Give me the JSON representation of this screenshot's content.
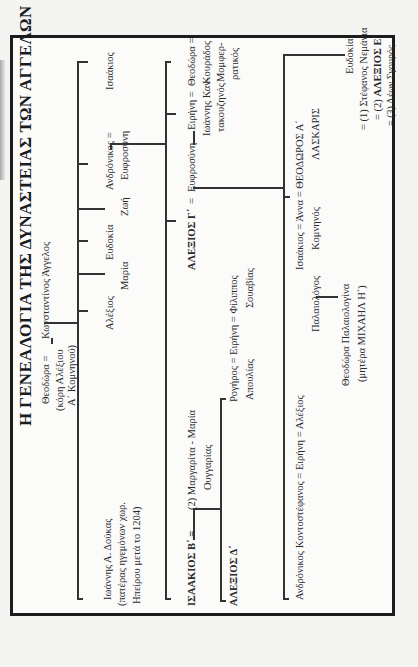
{
  "title": "Η ΓΕΝΕΑΛΟΓΙΑ ΤΗΣ ΔΥΝΑΣΤΕΙΑΣ ΤΩΝ ΑΓΓΕΛΩΝ",
  "orientation": "rotated 90° counter-clockwise",
  "generation1": {
    "wife": "Θεοδώρα =",
    "wife_note_1": "(κόρη Αλέξιου",
    "wife_note_2": "Α΄ Κομνηνού)",
    "husband": "Κωνσταντίνος Άγγελος"
  },
  "generation2": [
    {
      "name": "Ιωάννης Α. Δούκας",
      "note_1": "(πατέρας ηγεμόνων χωρ.",
      "note_2": "Ηπείρου μετά το 1204)"
    },
    {
      "name": "Αλέξιος"
    },
    {
      "name": "Μαρία"
    },
    {
      "name": "Ευδοκία"
    },
    {
      "name": "Ζωή"
    },
    {
      "name": "Ανδρόνικος =",
      "spouse": "Ευφροσύνη"
    },
    {
      "name": "Ισαάκιος"
    }
  ],
  "generation3": {
    "isaac": {
      "name": "ΙΣΑΑΚΙΟΣ Β΄ =",
      "spouse": "(2) Μαργαρίτα - Μαρία",
      "spouse_note": "Ουγγαρίας"
    },
    "alexios3": {
      "name": "ΑΛΕΞΙΟΣ Γ΄",
      "eq": "=",
      "spouse": "Ευφροσύνη"
    },
    "irene": {
      "name": "Ειρήνη =",
      "spouse_1": "Ιωάννης Καν-",
      "spouse_2": "τακουζηνός"
    },
    "theodora": {
      "name": "Θεοδώρα =",
      "spouse_1": "Κουράδος",
      "spouse_2": "Μομφερ-",
      "spouse_3": "ρατικός"
    }
  },
  "generation4_isaac": {
    "alexios4": "ΑΛΕΞΙΟΣ Δ΄",
    "irene_line": "Ρογήρος = Ειρήνη = Φίλιππος",
    "irene_note_1": "Απουλίας",
    "irene_note_2": "Σουαβίας"
  },
  "generation4_alexios": {
    "irene": {
      "line": "Ανδρόνικος Κοντοστέφανος = Ειρήνη = Αλέξιος",
      "note": "Παλαιολόγος"
    },
    "anna": {
      "line": "Ισαάκιος = Άννα = ΘΕΟΔΩΡΟΣ Α΄",
      "note_1": "Κομνηνός",
      "note_2": "ΛΑΣΚΑΡΙΣ"
    },
    "eudokia": {
      "name": "Ευδοκία",
      "m1": "= (1) Στέφανος Νεμάνια",
      "m2_pre": "= (2) ",
      "m2": "ΑΛΕΞΙΟΣ Ε΄",
      "m3": "= (3) Λέων Σγουρός"
    }
  },
  "generation5": {
    "name": "Θεοδώρα Παλαιολογίνα",
    "note": "(μητέρα ΜΙΧΑΗΛ Η΄)"
  }
}
